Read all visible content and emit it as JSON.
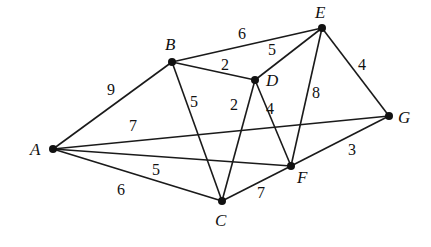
{
  "graph": {
    "nodes": [
      {
        "id": "A",
        "label": "A",
        "x": 53,
        "y": 149,
        "lx": 30,
        "ly": 155
      },
      {
        "id": "B",
        "label": "B",
        "x": 172,
        "y": 62,
        "lx": 165,
        "ly": 50
      },
      {
        "id": "C",
        "label": "C",
        "x": 222,
        "y": 201,
        "lx": 215,
        "ly": 226
      },
      {
        "id": "D",
        "label": "D",
        "x": 255,
        "y": 80,
        "lx": 266,
        "ly": 86
      },
      {
        "id": "E",
        "label": "E",
        "x": 322,
        "y": 28,
        "lx": 315,
        "ly": 18
      },
      {
        "id": "F",
        "label": "F",
        "x": 291,
        "y": 166,
        "lx": 297,
        "ly": 183
      },
      {
        "id": "G",
        "label": "G",
        "x": 389,
        "y": 116,
        "lx": 398,
        "ly": 123
      }
    ],
    "edges": [
      {
        "from": "A",
        "to": "B",
        "weight": "9",
        "lx": 111,
        "ly": 95
      },
      {
        "from": "A",
        "to": "G",
        "weight": "7",
        "lx": 133,
        "ly": 131
      },
      {
        "from": "A",
        "to": "F",
        "weight": "5",
        "lx": 156,
        "ly": 175
      },
      {
        "from": "A",
        "to": "C",
        "weight": "6",
        "lx": 121,
        "ly": 195
      },
      {
        "from": "B",
        "to": "E",
        "weight": "6",
        "lx": 242,
        "ly": 39
      },
      {
        "from": "B",
        "to": "D",
        "weight": "2",
        "lx": 225,
        "ly": 70
      },
      {
        "from": "B",
        "to": "C",
        "weight": "5",
        "lx": 194,
        "ly": 107
      },
      {
        "from": "D",
        "to": "E",
        "weight": "5",
        "lx": 272,
        "ly": 55
      },
      {
        "from": "D",
        "to": "C",
        "weight": "2",
        "lx": 234,
        "ly": 110
      },
      {
        "from": "D",
        "to": "F",
        "weight": "4",
        "lx": 270,
        "ly": 114
      },
      {
        "from": "E",
        "to": "F",
        "weight": "8",
        "lx": 316,
        "ly": 98
      },
      {
        "from": "E",
        "to": "G",
        "weight": "4",
        "lx": 362,
        "ly": 70
      },
      {
        "from": "G",
        "to": "F",
        "weight": "3",
        "lx": 352,
        "ly": 155
      },
      {
        "from": "C",
        "to": "F",
        "weight": "7",
        "lx": 261,
        "ly": 198
      }
    ]
  }
}
